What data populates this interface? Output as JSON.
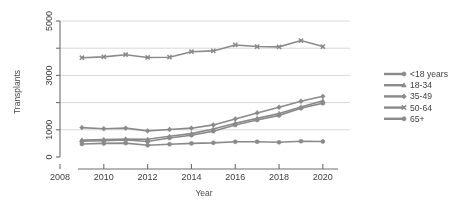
{
  "chart_data": {
    "type": "line",
    "title": "",
    "subtitle": "",
    "xlabel": "Year",
    "ylabel": "Transplants",
    "x": [
      2009,
      2010,
      2011,
      2012,
      2013,
      2014,
      2015,
      2016,
      2017,
      2018,
      2019,
      2020
    ],
    "xlim": [
      2008,
      2020.6
    ],
    "ylim": [
      0,
      5000
    ],
    "xticks": [
      2008,
      2010,
      2012,
      2014,
      2016,
      2018,
      2020
    ],
    "xtick_labels": [
      "2008",
      "2010",
      "2012",
      "2014",
      "2016",
      "2018",
      "2020"
    ],
    "yticks": [
      0,
      1000,
      2000,
      3000,
      4000,
      5000
    ],
    "ytick_labels": [
      "0",
      "1000",
      "",
      "3000",
      "",
      "5000"
    ],
    "grid": true,
    "grid_axis": "y",
    "legend_position": "right",
    "line_color": "#8a8a8a",
    "grid_color": "#c9c9c9",
    "axis_color": "#6e6e6e",
    "series": [
      {
        "name": "<18 years",
        "marker": "circle",
        "values": [
          480,
          500,
          510,
          430,
          470,
          500,
          520,
          560,
          560,
          540,
          580,
          570
        ]
      },
      {
        "name": "18-34",
        "marker": "triangle",
        "values": [
          620,
          640,
          660,
          650,
          760,
          860,
          1030,
          1240,
          1420,
          1600,
          1840,
          2070
        ]
      },
      {
        "name": "35-49",
        "marker": "diamond",
        "values": [
          1080,
          1040,
          1060,
          960,
          1010,
          1060,
          1180,
          1400,
          1620,
          1830,
          2050,
          2230
        ]
      },
      {
        "name": "50-64",
        "marker": "x",
        "values": [
          3650,
          3680,
          3760,
          3660,
          3670,
          3870,
          3900,
          4120,
          4060,
          4050,
          4280,
          4060
        ]
      },
      {
        "name": "65+",
        "marker": "circle",
        "values": [
          580,
          600,
          630,
          570,
          700,
          800,
          950,
          1180,
          1360,
          1530,
          1790,
          1980
        ]
      }
    ]
  }
}
